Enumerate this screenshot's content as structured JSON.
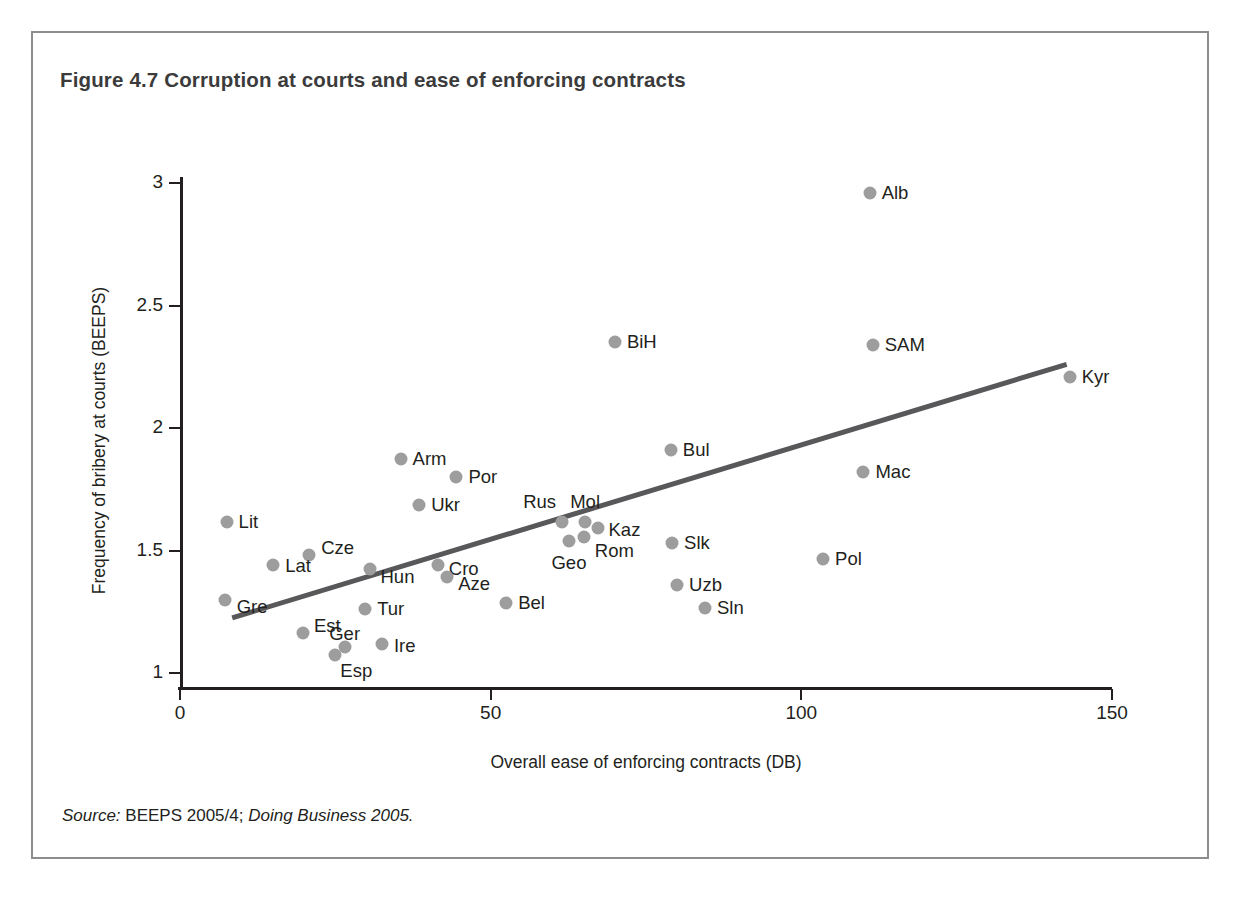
{
  "figure": {
    "title": "Figure 4.7  Corruption at courts and ease of enforcing contracts",
    "source_prefix": "Source:",
    "source_mid": " BEEPS 2005/4; ",
    "source_italic": "Doing Business 2005."
  },
  "chart_data": {
    "type": "scatter",
    "title": "Figure 4.7  Corruption at courts and ease of enforcing contracts",
    "xlabel": "Overall ease of enforcing contracts (DB)",
    "ylabel": "Frequency of bribery at courts (BEEPS)",
    "xlim": [
      0,
      150
    ],
    "ylim": [
      1,
      3
    ],
    "xticks": [
      "0",
      "50",
      "100",
      "150"
    ],
    "xtick_values": [
      0,
      50,
      100,
      150
    ],
    "yticks": [
      "1",
      "1.5",
      "2",
      "2.5",
      "3"
    ],
    "ytick_values": [
      1,
      1.5,
      2,
      2.5,
      3
    ],
    "grid": false,
    "legend": null,
    "point_color": "#9d9d9d",
    "trend_color": "#58585a",
    "points": [
      {
        "label": "Alb",
        "x": 111.0,
        "y": 2.96,
        "lx": 12,
        "ly": 0
      },
      {
        "label": "SAM",
        "x": 111.5,
        "y": 2.34,
        "lx": 12,
        "ly": 0
      },
      {
        "label": "Kyr",
        "x": 143.2,
        "y": 2.21,
        "lx": 12,
        "ly": 0
      },
      {
        "label": "BiH",
        "x": 70.0,
        "y": 2.35,
        "lx": 12,
        "ly": 0
      },
      {
        "label": "Bul",
        "x": 79.0,
        "y": 1.91,
        "lx": 12,
        "ly": 0
      },
      {
        "label": "Mac",
        "x": 110.0,
        "y": 1.82,
        "lx": 12,
        "ly": 0
      },
      {
        "label": "Arm",
        "x": 35.5,
        "y": 1.875,
        "lx": 12,
        "ly": 0
      },
      {
        "label": "Por",
        "x": 44.5,
        "y": 1.8,
        "lx": 12,
        "ly": 0
      },
      {
        "label": "Ukr",
        "x": 38.5,
        "y": 1.685,
        "lx": 12,
        "ly": 0
      },
      {
        "label": "Lit",
        "x": 7.5,
        "y": 1.615,
        "lx": 12,
        "ly": 0
      },
      {
        "label": "Rus",
        "x": 61.5,
        "y": 1.615,
        "lx": -6,
        "ly": -20,
        "anchor": "end"
      },
      {
        "label": "Mol",
        "x": 65.2,
        "y": 1.615,
        "lx": 0,
        "ly": -20,
        "anchor": "middle"
      },
      {
        "label": "Kaz",
        "x": 67.2,
        "y": 1.59,
        "lx": 11,
        "ly": 2
      },
      {
        "label": "Geo",
        "x": 62.6,
        "y": 1.54,
        "lx": 0,
        "ly": 22,
        "anchor": "middle"
      },
      {
        "label": "Rom",
        "x": 65.0,
        "y": 1.555,
        "lx": 11,
        "ly": 14
      },
      {
        "label": "Slk",
        "x": 79.2,
        "y": 1.53,
        "lx": 12,
        "ly": 0
      },
      {
        "label": "Cze",
        "x": 20.8,
        "y": 1.48,
        "lx": 12,
        "ly": -7
      },
      {
        "label": "Pol",
        "x": 103.5,
        "y": 1.465,
        "lx": 12,
        "ly": 0
      },
      {
        "label": "Lat",
        "x": 15.0,
        "y": 1.44,
        "lx": 12,
        "ly": 1
      },
      {
        "label": "Hun",
        "x": 30.5,
        "y": 1.425,
        "lx": 11,
        "ly": 8
      },
      {
        "label": "Cro",
        "x": 41.5,
        "y": 1.44,
        "lx": 11,
        "ly": 4
      },
      {
        "label": "Aze",
        "x": 43.0,
        "y": 1.39,
        "lx": 11,
        "ly": 7
      },
      {
        "label": "Uzb",
        "x": 80.0,
        "y": 1.36,
        "lx": 12,
        "ly": 0
      },
      {
        "label": "Gre",
        "x": 7.2,
        "y": 1.3,
        "lx": 12,
        "ly": 7
      },
      {
        "label": "Bel",
        "x": 52.5,
        "y": 1.285,
        "lx": 12,
        "ly": 0
      },
      {
        "label": "Sln",
        "x": 84.5,
        "y": 1.265,
        "lx": 12,
        "ly": 0
      },
      {
        "label": "Tur",
        "x": 29.8,
        "y": 1.26,
        "lx": 12,
        "ly": 0
      },
      {
        "label": "Est",
        "x": 19.8,
        "y": 1.165,
        "lx": 11,
        "ly": -7
      },
      {
        "label": "Ger",
        "x": 26.5,
        "y": 1.108,
        "lx": 0,
        "ly": -13,
        "anchor": "middle"
      },
      {
        "label": "Esp",
        "x": 25.0,
        "y": 1.075,
        "lx": 5,
        "ly": 16
      },
      {
        "label": "Ire",
        "x": 32.5,
        "y": 1.12,
        "lx": 12,
        "ly": 2
      }
    ],
    "trend_line": {
      "x0": 8.4,
      "y0": 1.225,
      "x1": 142.7,
      "y1": 2.26
    }
  }
}
